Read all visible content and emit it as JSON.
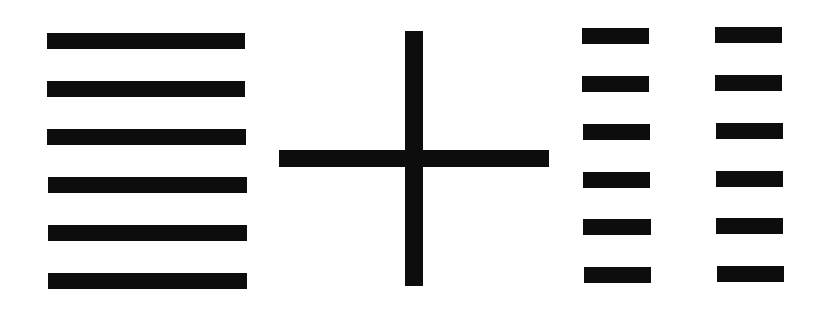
{
  "canvas": {
    "width": 826,
    "height": 309,
    "background": "#ffffff"
  },
  "colors": {
    "stroke": "#0d0d0d"
  },
  "left_group": {
    "description": "six solid horizontal lines",
    "bars": [
      {
        "x": 47,
        "y": 33,
        "w": 198,
        "h": 16
      },
      {
        "x": 47,
        "y": 81,
        "w": 198,
        "h": 16
      },
      {
        "x": 47,
        "y": 129,
        "w": 199,
        "h": 16
      },
      {
        "x": 48,
        "y": 177,
        "w": 199,
        "h": 16
      },
      {
        "x": 48,
        "y": 225,
        "w": 199,
        "h": 16
      },
      {
        "x": 48,
        "y": 273,
        "w": 199,
        "h": 16
      }
    ]
  },
  "plus_sign": {
    "vertical": {
      "x": 405,
      "y": 31,
      "w": 18,
      "h": 255
    },
    "horizontal": {
      "x": 279,
      "y": 150,
      "w": 270,
      "h": 17
    }
  },
  "right_group": {
    "description": "six broken lines (two columns of short bars)",
    "bars": [
      {
        "x": 582,
        "y": 28,
        "w": 67,
        "h": 16
      },
      {
        "x": 715,
        "y": 27,
        "w": 67,
        "h": 16
      },
      {
        "x": 582,
        "y": 76,
        "w": 67,
        "h": 16
      },
      {
        "x": 715,
        "y": 75,
        "w": 67,
        "h": 16
      },
      {
        "x": 583,
        "y": 124,
        "w": 67,
        "h": 16
      },
      {
        "x": 716,
        "y": 123,
        "w": 67,
        "h": 16
      },
      {
        "x": 583,
        "y": 172,
        "w": 67,
        "h": 16
      },
      {
        "x": 716,
        "y": 171,
        "w": 67,
        "h": 16
      },
      {
        "x": 583,
        "y": 219,
        "w": 68,
        "h": 16
      },
      {
        "x": 716,
        "y": 218,
        "w": 67,
        "h": 16
      },
      {
        "x": 584,
        "y": 267,
        "w": 67,
        "h": 16
      },
      {
        "x": 717,
        "y": 266,
        "w": 67,
        "h": 16
      }
    ]
  }
}
